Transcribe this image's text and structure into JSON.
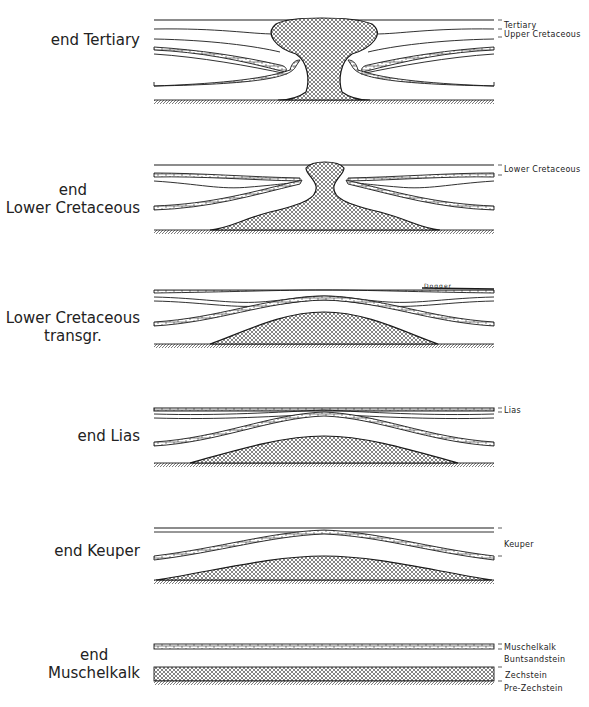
{
  "figure": {
    "stages": [
      {
        "id": "end-tertiary",
        "lines": [
          "end Tertiary"
        ],
        "units": [
          "Tertiary",
          "Upper Cretaceous"
        ]
      },
      {
        "id": "end-lower-cretaceous",
        "lines": [
          "end",
          "Lower Cretaceous"
        ],
        "units": [
          "Lower Cretaceous"
        ]
      },
      {
        "id": "lower-cretaceous-transgr",
        "lines": [
          "Lower Cretaceous",
          "transgr."
        ],
        "units": [
          "Dogger"
        ]
      },
      {
        "id": "end-lias",
        "lines": [
          "end Lias"
        ],
        "units": [
          "Lias"
        ]
      },
      {
        "id": "end-keuper",
        "lines": [
          "end Keuper"
        ],
        "units": [
          "Keuper"
        ]
      },
      {
        "id": "end-muschelkalk",
        "lines": [
          "end",
          "Muschelkalk"
        ],
        "units": [
          "Muschelkalk",
          "Buntsandstein",
          "Zechstein",
          "Pre-Zechstein"
        ]
      }
    ]
  },
  "legend_patterns": {
    "salt": "crosshatch",
    "limestone": "brick",
    "basement": "diagonal-hatch"
  },
  "colors": {
    "ink": "#1a1a1a",
    "paper": "#ffffff"
  }
}
